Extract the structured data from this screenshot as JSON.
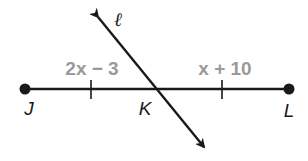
{
  "diagram": {
    "type": "geometry-segment-bisector",
    "points": [
      {
        "name": "J",
        "x": 25,
        "y": 89
      },
      {
        "name": "K",
        "x": 154,
        "y": 89
      },
      {
        "name": "L",
        "x": 289,
        "y": 89
      }
    ],
    "segment": {
      "from": "J",
      "to": "L"
    },
    "line": {
      "name": "ℓ",
      "passes_through": "K",
      "arrows": "both"
    },
    "segment_labels": {
      "JK": "2x − 3",
      "KL": "x + 10"
    },
    "congruence_ticks": 2,
    "colors": {
      "stroke": "#1a1a1a",
      "expression": "#9a9a9a"
    }
  }
}
